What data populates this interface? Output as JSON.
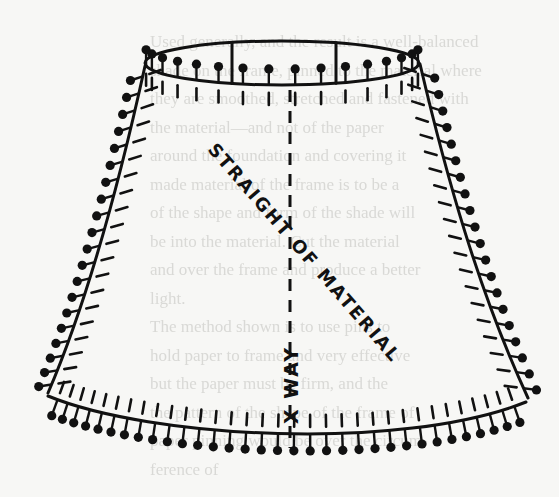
{
  "diagram": {
    "labels": {
      "diagonal": "STRAIGHT OF MATERIAL",
      "vertical": "X WAY"
    },
    "colors": {
      "background": "#f7f7f5",
      "ink": "#111111",
      "bleed_text": "#d9d9d6"
    },
    "frame": {
      "top_ring": {
        "cx": 282,
        "cy": 63,
        "rx": 137,
        "ry": 22
      },
      "top_struts_x": [
        232,
        336
      ],
      "left_side": [
        [
          145,
          66
        ],
        [
          120,
          180
        ],
        [
          88,
          300
        ],
        [
          48,
          393
        ]
      ],
      "right_side": [
        [
          420,
          64
        ],
        [
          446,
          175
        ],
        [
          478,
          290
        ],
        [
          528,
          398
        ]
      ],
      "bottom_curve": [
        [
          48,
          396
        ],
        [
          150,
          438
        ],
        [
          400,
          452
        ],
        [
          526,
          402
        ]
      ],
      "center_line": {
        "x": 290,
        "y1": 90,
        "y2": 448
      }
    },
    "pins": {
      "top_count": 16,
      "left_count": 20,
      "right_count": 20,
      "bottom_count": 33
    },
    "bleed_through_lines": [
      "Used generally, and the result is a well-balanced",
      "shade on the frame, pinned to the material where",
      "they are smoothed, stretched and fastened with",
      "the material—and not of the paper",
      "around the foundation and covering it",
      "made material of the frame is to be a",
      "of the shape and form of the shade will",
      "be into the material. Cut the material",
      "and over the frame and produce a better",
      "light.",
      "The method shown is to use pins to",
      "hold paper to frame and very effective",
      "but the paper must be firm, and the",
      "the pattern of the shape of the frame of",
      "paper pinning would be over the circum-",
      "ference of"
    ]
  }
}
